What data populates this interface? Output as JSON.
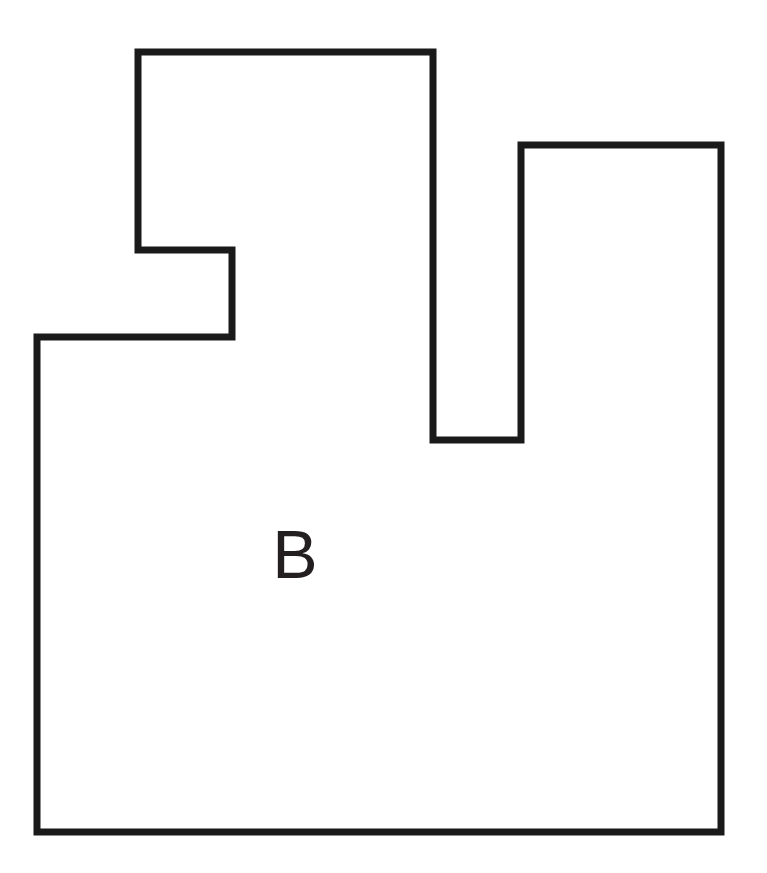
{
  "figure": {
    "kind": "polygon-outline-diagram",
    "background_color": "#ffffff",
    "stroke_color": "#1a1a1a",
    "fill_color": "#ffffff",
    "stroke_width": 7,
    "canvas": {
      "width": 767,
      "height": 873
    },
    "label": {
      "text": "B",
      "x": 295,
      "y": 578,
      "font_size": 68,
      "color": "#231f20"
    },
    "shape": {
      "name": "rectilinear-polygon-b",
      "closed": true,
      "points": [
        [
          138,
          52
        ],
        [
          433,
          52
        ],
        [
          433,
          440
        ],
        [
          521,
          440
        ],
        [
          521,
          145
        ],
        [
          721,
          145
        ],
        [
          721,
          832
        ],
        [
          37,
          832
        ],
        [
          37,
          337
        ],
        [
          232,
          337
        ],
        [
          232,
          250
        ],
        [
          138,
          250
        ]
      ],
      "path_d": "M 138 52 L 433 52 L 433 440 L 521 440 L 521 145 L 721 145 L 721 832 L 37 832 L 37 337 L 232 337 L 232 250 L 138 250 Z"
    }
  }
}
